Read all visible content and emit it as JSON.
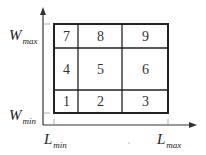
{
  "diagram": {
    "type": "partitioned-rectangle-grid",
    "axes": {
      "y": {
        "max_label": {
          "main": "W",
          "sub": "max"
        },
        "min_label": {
          "main": "W",
          "sub": "min"
        }
      },
      "x": {
        "min_label": {
          "main": "L",
          "sub": "min"
        },
        "max_label": {
          "main": "L",
          "sub": "max"
        }
      }
    },
    "grid": {
      "rows": [
        [
          "7",
          "8",
          "9"
        ],
        [
          "4",
          "5",
          "6"
        ],
        [
          "1",
          "2",
          "3"
        ]
      ]
    },
    "colors": {
      "line": "#222222",
      "text": "#333333",
      "background": "#ffffff"
    }
  }
}
